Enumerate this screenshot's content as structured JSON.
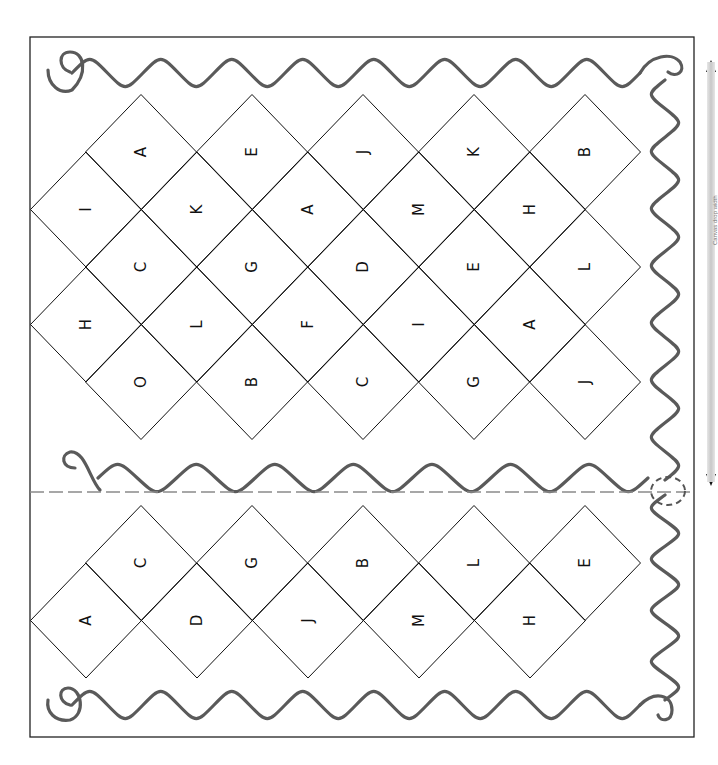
{
  "sheet": {
    "title": "Letter matching diamond grid worksheet",
    "border_color": "#222222",
    "wave_color": "#5a5a5a",
    "dashed_color": "#8a8a8a",
    "cut_line": "dashed fold/cut line with scissors-style dashed circle"
  },
  "top_grid": {
    "rows": [
      {
        "letters": [
          "A",
          "E",
          "J",
          "K",
          "B"
        ]
      },
      {
        "letters": [
          "I",
          "K",
          "A",
          "M",
          "H"
        ]
      },
      {
        "letters": [
          "C",
          "G",
          "D",
          "E",
          "L"
        ]
      },
      {
        "letters": [
          "H",
          "L",
          "F",
          "I",
          "A"
        ]
      },
      {
        "letters": [
          "O",
          "B",
          "C",
          "G",
          "J"
        ]
      }
    ]
  },
  "bottom_grid": {
    "rows": [
      {
        "letters": [
          "C",
          "G",
          "B",
          "L",
          "E"
        ]
      },
      {
        "letters": [
          "A",
          "D",
          "J",
          "M",
          "H"
        ]
      }
    ]
  },
  "dimension_indicator": {
    "label": "Canvas drop width",
    "arrow_up": "arrow-up-icon",
    "arrow_down": "arrow-down-icon"
  }
}
